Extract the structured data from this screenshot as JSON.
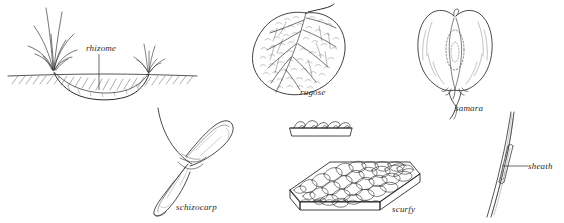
{
  "plate": {
    "kind": "botanical-terminology-illustration-plate",
    "background_color": "#ffffff",
    "ink_color": "#2b2b2b",
    "width": 564,
    "height": 223
  },
  "figures": [
    {
      "id": "rhizome",
      "label": "rhizome",
      "description": "Cross-section of soil showing a horizontal underground rhizome connecting two grass tufts, with hatched ground line",
      "has_leader_line": true,
      "leader_orientation": "vertical",
      "position": "top-left"
    },
    {
      "id": "rugose",
      "label": "rugose",
      "description": "Broad heart-shaped leaf with deeply wrinkled, pebbled surface and a petiole",
      "has_leader_line": false,
      "position": "top-center"
    },
    {
      "id": "samara",
      "label": "samara",
      "description": "Paired winged fruit with a central seed body and forked stalk at base",
      "has_leader_line": false,
      "position": "top-right"
    },
    {
      "id": "schizocarp",
      "label": "schizocarp",
      "description": "Two-lobed splitting fruit with slender curved stalk crossing at the middle",
      "has_leader_line": false,
      "position": "bottom-left"
    },
    {
      "id": "scurfy",
      "label": "scurfy",
      "description": "Isometric slab covered with overlapping scales, with an edge-on cross-section above showing raised scale projections",
      "has_leader_line": false,
      "position": "bottom-center"
    },
    {
      "id": "sheath",
      "label": "sheath",
      "description": "Slender grass culm with a leaf sheath wrapping the stem, indicated by a horizontal leader line",
      "has_leader_line": true,
      "leader_orientation": "horizontal",
      "position": "bottom-right"
    }
  ]
}
